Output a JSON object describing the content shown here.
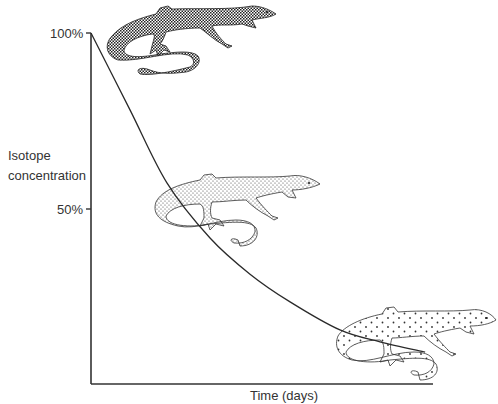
{
  "figure": {
    "title": "",
    "lizard_labels": [
      "lizard-high-concentration",
      "lizard-medium-concentration",
      "lizard-low-concentration"
    ]
  },
  "chart_data": {
    "type": "line",
    "title": "",
    "xlabel": "Time (days)",
    "ylabel_lines": [
      "Isotope",
      "concentration"
    ],
    "y_ticks": [
      "100%",
      "50%"
    ],
    "y_tick_values": [
      100,
      50
    ],
    "ylim": [
      0,
      100
    ],
    "xlim": [
      0,
      1
    ],
    "grid": false,
    "legend": "none",
    "series": [
      {
        "name": "Isotope concentration",
        "x": [
          0,
          0.114,
          0.222,
          0.348,
          0.465,
          0.582,
          0.728,
          0.845,
          0.977
        ],
        "y": [
          100,
          78.1,
          57.3,
          41.6,
          31.3,
          23.4,
          15.4,
          12.0,
          9.1
        ]
      }
    ],
    "color": "#2a2a2a"
  }
}
